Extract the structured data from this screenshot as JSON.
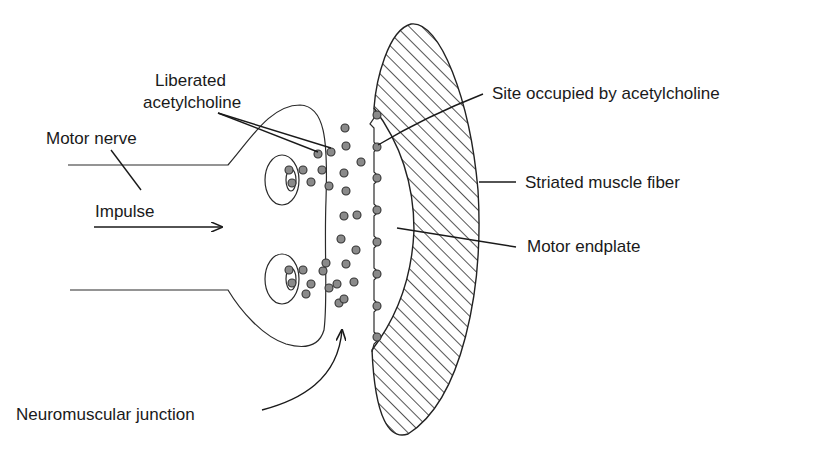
{
  "figure": {
    "labels": {
      "liberated_acetylcholine_line1": "Liberated",
      "liberated_acetylcholine_line2": "acetylcholine",
      "motor_nerve": "Motor nerve",
      "impulse": "Impulse",
      "neuromuscular_junction": "Neuromuscular junction",
      "site_occupied": "Site occupied by acetylcholine",
      "striated_muscle_fiber": "Striated muscle fiber",
      "motor_endplate": "Motor endplate"
    },
    "colors": {
      "line": "#2a2a2a",
      "acetylcholine_fill": "#8a8a8a",
      "hatch": "#555555",
      "background": "#ffffff"
    }
  }
}
